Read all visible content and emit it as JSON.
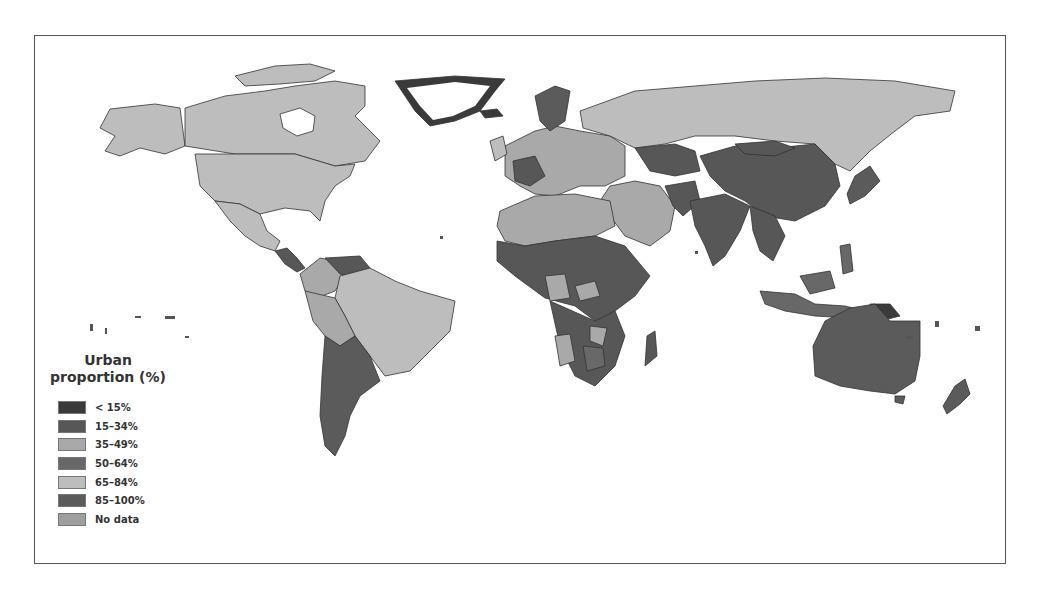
{
  "map": {
    "type": "choropleth",
    "subject": "Urban proportion by country",
    "projection": "world (equirectangular-like)"
  },
  "legend": {
    "title_line1": "Urban",
    "title_line2": "proportion (%)",
    "items": [
      {
        "label": "< 15%",
        "color": "#3a3a3a"
      },
      {
        "label": "15–34%",
        "color": "#575757"
      },
      {
        "label": "35–49%",
        "color": "#a9a9a9"
      },
      {
        "label": "50–64%",
        "color": "#686868"
      },
      {
        "label": "65–84%",
        "color": "#bdbdbd"
      },
      {
        "label": "85–100%",
        "color": "#5b5b5b"
      },
      {
        "label": "No data",
        "color": "#9e9e9e"
      }
    ]
  },
  "colors": {
    "border": "#555555",
    "country_outline": "#333333",
    "background": "#ffffff"
  }
}
